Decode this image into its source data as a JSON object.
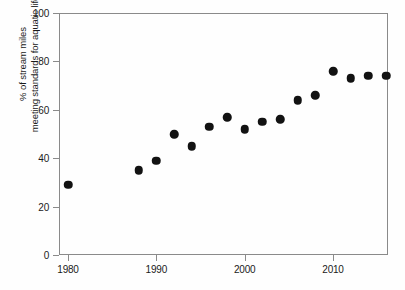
{
  "chart_data": {
    "type": "scatter",
    "title": "",
    "xlabel": "",
    "ylabel_line1": "% of stream miles",
    "ylabel_line2": "meeting standards for aquatic life",
    "xlim": [
      1978,
      2018
    ],
    "ylim": [
      0,
      100
    ],
    "grid": false,
    "legend": "none",
    "marker": "filled-circle",
    "marker_color": "#121212",
    "frame_color": "#8a8a8a",
    "background_color": "#fefefe",
    "y_ticks": [
      0,
      20,
      40,
      60,
      80,
      100
    ],
    "y_tick_labels": [
      "0",
      "20",
      "40",
      "60",
      "80",
      "100"
    ],
    "x_ticks": [
      1980,
      1990,
      2000,
      2010
    ],
    "x_tick_labels": [
      "1980",
      "1990",
      "2000",
      "2010"
    ],
    "x": [
      1980,
      1988,
      1990,
      1992,
      1994,
      1996,
      1998,
      2000,
      2002,
      2004,
      2006,
      2008,
      2010,
      2012,
      2014,
      2016
    ],
    "values": [
      29,
      35,
      39,
      50,
      45,
      53,
      57,
      52,
      55,
      56,
      64,
      66,
      76,
      73,
      74,
      74
    ],
    "points": [
      {
        "x": 1980,
        "y": 29
      },
      {
        "x": 1988,
        "y": 35
      },
      {
        "x": 1990,
        "y": 39
      },
      {
        "x": 1992,
        "y": 50
      },
      {
        "x": 1994,
        "y": 45
      },
      {
        "x": 1996,
        "y": 53
      },
      {
        "x": 1998,
        "y": 57
      },
      {
        "x": 2000,
        "y": 52
      },
      {
        "x": 2002,
        "y": 55
      },
      {
        "x": 2004,
        "y": 56
      },
      {
        "x": 2006,
        "y": 64
      },
      {
        "x": 2008,
        "y": 66
      },
      {
        "x": 2010,
        "y": 76
      },
      {
        "x": 2012,
        "y": 73
      },
      {
        "x": 2014,
        "y": 74
      },
      {
        "x": 2016,
        "y": 74
      }
    ]
  }
}
